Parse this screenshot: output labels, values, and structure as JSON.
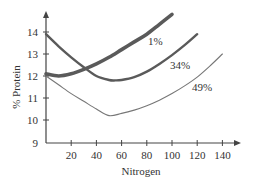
{
  "chart_data": {
    "type": "line",
    "title": "",
    "xlabel": "Nitrogen",
    "ylabel": "% Protein",
    "xlim": [
      0,
      150
    ],
    "ylim": [
      9,
      14.8
    ],
    "x_ticks": [
      20,
      40,
      60,
      80,
      100,
      120,
      140
    ],
    "y_ticks": [
      9,
      10,
      11,
      12,
      13,
      14
    ],
    "grid": false,
    "legend": "inline labels",
    "series": [
      {
        "name": "1%",
        "style": "thick",
        "color": "#5a5a5a",
        "x": [
          0,
          10,
          20,
          30,
          40,
          50,
          60,
          70,
          80,
          90,
          100
        ],
        "y": [
          12.1,
          12.0,
          12.1,
          12.3,
          12.55,
          12.85,
          13.2,
          13.55,
          13.9,
          14.35,
          14.8
        ]
      },
      {
        "name": "34%",
        "style": "medium",
        "color": "#5a5a5a",
        "x": [
          0,
          10,
          20,
          30,
          40,
          50,
          55,
          60,
          70,
          80,
          90,
          100,
          110,
          120
        ],
        "y": [
          13.9,
          13.35,
          12.85,
          12.4,
          12.0,
          11.82,
          11.8,
          11.82,
          11.95,
          12.2,
          12.55,
          12.95,
          13.4,
          13.9
        ]
      },
      {
        "name": "49%",
        "style": "thin",
        "color": "#777777",
        "x": [
          0,
          10,
          20,
          30,
          40,
          50,
          60,
          70,
          80,
          90,
          100,
          110,
          120,
          130,
          140
        ],
        "y": [
          12.0,
          11.6,
          11.2,
          10.85,
          10.5,
          10.2,
          10.3,
          10.45,
          10.65,
          10.9,
          11.2,
          11.55,
          11.95,
          12.45,
          13.0
        ]
      }
    ]
  }
}
